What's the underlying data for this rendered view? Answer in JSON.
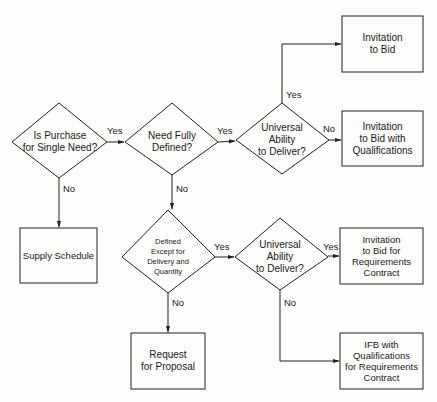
{
  "diagram": {
    "type": "flowchart",
    "colors": {
      "line": "#222222",
      "background": "#fdfdfb",
      "text": "#1a1a1a"
    },
    "nodes": {
      "d1": {
        "shape": "diamond",
        "label": "Is Purchase\nfor Single Need?"
      },
      "d2": {
        "shape": "diamond",
        "label": "Need Fully\nDefined?"
      },
      "d3": {
        "shape": "diamond",
        "label": "Universal\nAbility\nto Deliver?"
      },
      "d4": {
        "shape": "diamond",
        "label": "Defined\nExcept for\nDelivery and\nQuantity"
      },
      "d5": {
        "shape": "diamond",
        "label": "Universal\nAbility\nto Deliver?"
      },
      "b_itb": {
        "shape": "box",
        "label": "Invitation\nto Bid"
      },
      "b_itbq": {
        "shape": "box",
        "label": "Invitation\nto Bid with\nQualifications"
      },
      "b_supply": {
        "shape": "box",
        "label": "Supply Schedule"
      },
      "b_itbrc": {
        "shape": "box",
        "label": "Invitation\nto Bid for\nRequirements\nContract"
      },
      "b_rfp": {
        "shape": "box",
        "label": "Request\nfor Proposal"
      },
      "b_ifbq": {
        "shape": "box",
        "label": "IFB with\nQualifications\nfor Requirements\nContract"
      }
    },
    "edges": {
      "d1_d2": {
        "from": "d1",
        "to": "d2",
        "label": "Yes"
      },
      "d1_supply": {
        "from": "d1",
        "to": "b_supply",
        "label": "No"
      },
      "d2_d3": {
        "from": "d2",
        "to": "d3",
        "label": "Yes"
      },
      "d2_d4": {
        "from": "d2",
        "to": "d4",
        "label": "No"
      },
      "d3_itb": {
        "from": "d3",
        "to": "b_itb",
        "label": "Yes"
      },
      "d3_itbq": {
        "from": "d3",
        "to": "b_itbq",
        "label": "No"
      },
      "d4_d5": {
        "from": "d4",
        "to": "d5",
        "label": "Yes"
      },
      "d4_rfp": {
        "from": "d4",
        "to": "b_rfp",
        "label": "No"
      },
      "d5_itbrc": {
        "from": "d5",
        "to": "b_itbrc",
        "label": "Yes"
      },
      "d5_ifbq": {
        "from": "d5",
        "to": "b_ifbq",
        "label": "No"
      }
    }
  }
}
